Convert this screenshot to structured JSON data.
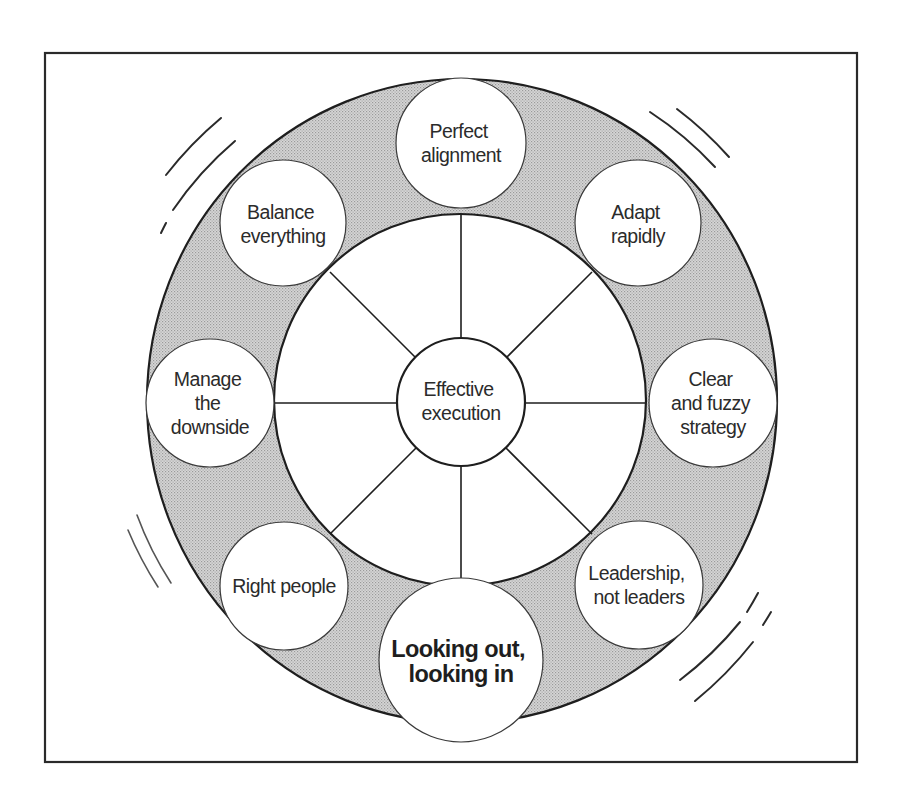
{
  "diagram": {
    "type": "wheel",
    "hub": {
      "lines": [
        "Effective",
        "execution"
      ]
    },
    "nodes": [
      {
        "id": "top",
        "position": "top",
        "lines": [
          "Perfect",
          "alignment"
        ],
        "emphasis": false
      },
      {
        "id": "top-right",
        "position": "top-right",
        "lines": [
          "Adapt",
          "rapidly"
        ],
        "emphasis": false
      },
      {
        "id": "right",
        "position": "right",
        "lines": [
          "Clear",
          "and fuzzy",
          "strategy"
        ],
        "emphasis": false
      },
      {
        "id": "bottom-right",
        "position": "bottom-right",
        "lines": [
          "Leadership,",
          "not leaders"
        ],
        "emphasis": false
      },
      {
        "id": "bottom",
        "position": "bottom",
        "lines": [
          "Looking out,",
          "looking in"
        ],
        "emphasis": true
      },
      {
        "id": "bottom-left",
        "position": "bottom-left",
        "lines": [
          "Right people"
        ],
        "emphasis": false
      },
      {
        "id": "left",
        "position": "left",
        "lines": [
          "Manage",
          "the",
          "downside"
        ],
        "emphasis": false
      },
      {
        "id": "top-left",
        "position": "top-left",
        "lines": [
          "Balance",
          "everything"
        ],
        "emphasis": false
      }
    ],
    "spoke_count": 8,
    "colors": {
      "ring_fill": "#c9c9c9",
      "stroke": "#1e1e1e",
      "background": "#ffffff"
    },
    "motion_marks": [
      "top-left",
      "top-right",
      "bottom-left",
      "bottom-right"
    ]
  }
}
